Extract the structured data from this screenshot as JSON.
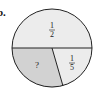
{
  "problem_label": "b.",
  "circle": {
    "top_half": {
      "label_num": "1",
      "label_den": "2",
      "fill": "#ececec"
    },
    "unknown_part": {
      "label": "?",
      "fill": "#d2d2d2"
    },
    "small_part": {
      "label_num": "1",
      "label_den": "5",
      "fill": "#ececec"
    },
    "stroke": "#222222"
  }
}
